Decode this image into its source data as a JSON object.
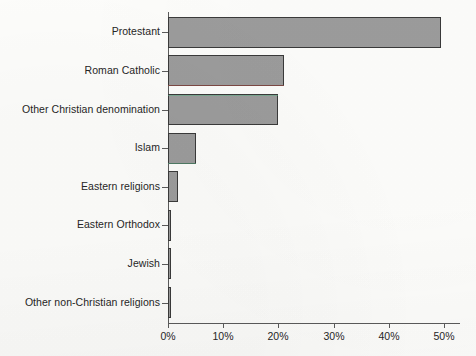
{
  "chart_data": {
    "type": "bar",
    "orientation": "horizontal",
    "title": "",
    "xlabel": "",
    "ylabel": "",
    "categories": [
      "Protestant",
      "Roman Catholic",
      "Other Christian denomination",
      "Islam",
      "Eastern religions",
      "Eastern Orthodox",
      "Jewish",
      "Other non-Christian religions"
    ],
    "values": [
      49.5,
      21.0,
      20.0,
      5.0,
      1.8,
      0.6,
      0.5,
      0.5
    ],
    "xlim": [
      0,
      53
    ],
    "xticks": [
      0,
      10,
      20,
      30,
      40,
      50
    ],
    "xticklabels": [
      "0%",
      "10%",
      "20%",
      "30%",
      "40%",
      "50%"
    ],
    "grid": false,
    "legend": false,
    "bar_color": "#9c9c9c",
    "bar_edge_color": "#3a3a3a",
    "axis_color": "#5b5b5b"
  },
  "axis": {
    "ticks": [
      {
        "label": "0%",
        "value": 0
      },
      {
        "label": "10%",
        "value": 10
      },
      {
        "label": "20%",
        "value": 20
      },
      {
        "label": "30%",
        "value": 30
      },
      {
        "label": "40%",
        "value": 40
      },
      {
        "label": "50%",
        "value": 50
      }
    ]
  },
  "bars": [
    {
      "label": "Protestant",
      "value": 49.5
    },
    {
      "label": "Roman Catholic",
      "value": 21.0
    },
    {
      "label": "Other Christian denomination",
      "value": 20.0
    },
    {
      "label": "Islam",
      "value": 5.0
    },
    {
      "label": "Eastern religions",
      "value": 1.8
    },
    {
      "label": "Eastern Orthodox",
      "value": 0.6
    },
    {
      "label": "Jewish",
      "value": 0.5
    },
    {
      "label": "Other non-Christian religions",
      "value": 0.5
    }
  ]
}
